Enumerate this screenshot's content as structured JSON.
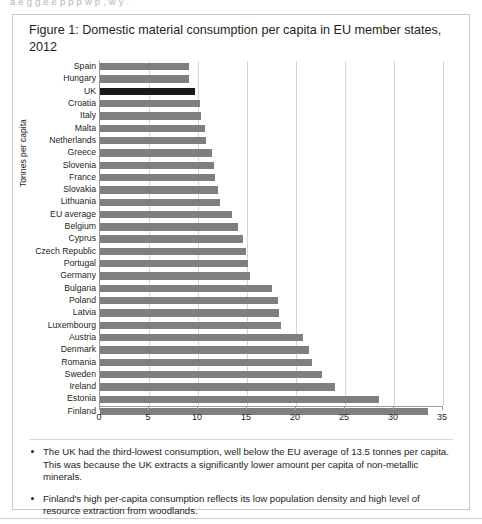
{
  "top_cut_text": "a  e  g g   e  e   p         p   p    w  p                  , w y       .",
  "figure": {
    "title": "Figure 1: Domestic material consumption per capita in EU member states, 2012"
  },
  "notes": [
    "The UK had the third-lowest consumption, well below the EU average of 13.5 tonnes per capita. This was because the UK extracts a significantly lower amount per capita of non-metallic minerals.",
    "Finland's high per-capita consumption reflects its low population density and high level of resource extraction from woodlands."
  ],
  "colors": {
    "bar": "#7f7f7f",
    "highlight": "#1a1a1a",
    "grid": "#d5d5d5",
    "axis": "#9a9a9a",
    "text": "#231f20",
    "border": "#c9c9c9"
  },
  "chart_data": {
    "type": "bar",
    "orientation": "horizontal",
    "title": "Figure 1: Domestic material consumption per capita in EU member states, 2012",
    "xlabel": "",
    "ylabel": "Tonnes per capita",
    "xlim": [
      0,
      35
    ],
    "xticks": [
      0,
      5,
      10,
      15,
      20,
      25,
      30,
      35
    ],
    "grid": true,
    "legend": "none",
    "highlight_category": "UK",
    "categories": [
      "Spain",
      "Hungary",
      "UK",
      "Croatia",
      "Italy",
      "Malta",
      "Netherlands",
      "Greece",
      "Slovenia",
      "France",
      "Slovakia",
      "Lithuania",
      "EU average",
      "Belgium",
      "Cyprus",
      "Czech Republic",
      "Portugal",
      "Germany",
      "Bulgaria",
      "Poland",
      "Latvia",
      "Luxembourg",
      "Austria",
      "Denmark",
      "Romania",
      "Sweden",
      "Ireland",
      "Estonia",
      "Finland"
    ],
    "values": [
      9.1,
      9.1,
      9.7,
      10.2,
      10.3,
      10.7,
      10.8,
      11.4,
      11.6,
      11.7,
      12.0,
      12.2,
      13.5,
      14.1,
      14.6,
      14.9,
      15.1,
      15.3,
      17.6,
      18.2,
      18.3,
      18.5,
      20.7,
      21.3,
      21.6,
      22.7,
      24.0,
      28.5,
      33.5
    ]
  }
}
